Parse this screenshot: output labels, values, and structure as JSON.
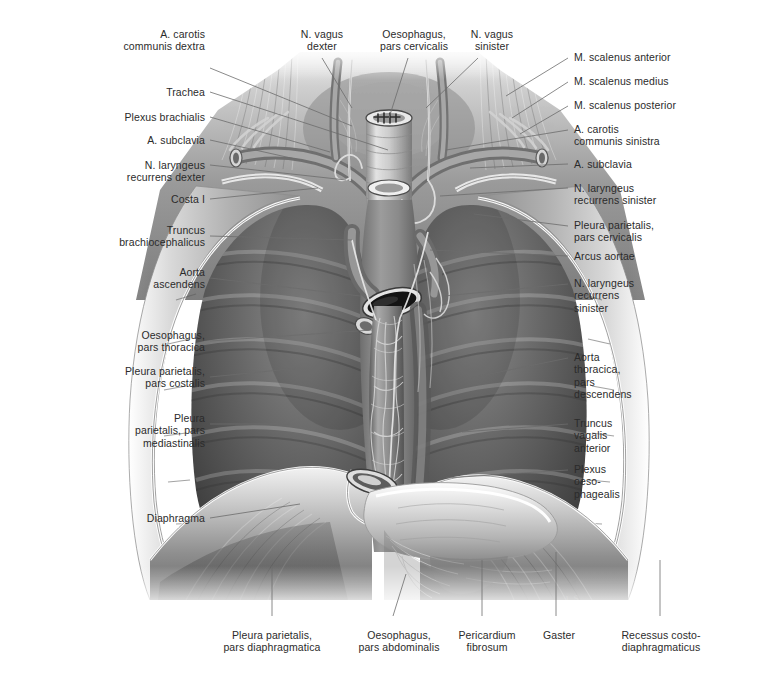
{
  "plate": {
    "title": "Thorax: situs of thoracic organs, anterior view",
    "width": 778,
    "height": 683,
    "background": "#ffffff",
    "text_color": "#2b2b2b",
    "leader_color": "#6c6c6c"
  },
  "labels": {
    "left": [
      {
        "id": "a-carotis-communis-dextra",
        "line1": "A. carotis",
        "line2": "communis dextra"
      },
      {
        "id": "trachea",
        "line1": "Trachea",
        "line2": ""
      },
      {
        "id": "plexus-brachialis",
        "line1": "Plexus brachialis",
        "line2": ""
      },
      {
        "id": "a-subclavia-dextra",
        "line1": "A. subclavia",
        "line2": ""
      },
      {
        "id": "n-laryngeus-recurrens-dexter",
        "line1": "N. laryngeus",
        "line2": "recurrens dexter"
      },
      {
        "id": "costa-i",
        "line1": "Costa I",
        "line2": ""
      },
      {
        "id": "truncus-brachiocephalicus",
        "line1": "Truncus",
        "line2": "brachiocephalicus"
      },
      {
        "id": "aorta-ascendens",
        "line1": "Aorta",
        "line2": "ascendens"
      },
      {
        "id": "oesophagus-pars-thoracica",
        "line1": "Oesophagus,",
        "line2": "pars thoracica"
      },
      {
        "id": "pleura-parietalis-pars-costalis",
        "line1": "Pleura parietalis,",
        "line2": "pars costalis"
      },
      {
        "id": "pleura-parietalis-pars-mediastinalis",
        "line1": "Pleura",
        "line2": "parietalis, pars",
        "line3": "mediastinalis"
      },
      {
        "id": "diaphragma",
        "line1": "Diaphragma",
        "line2": ""
      }
    ],
    "top": [
      {
        "id": "n-vagus-dexter",
        "line1": "N. vagus",
        "line2": "dexter"
      },
      {
        "id": "oesophagus-pars-cervicalis",
        "line1": "Oesophagus,",
        "line2": "pars cervicalis"
      },
      {
        "id": "n-vagus-sinister",
        "line1": "N. vagus",
        "line2": "sinister"
      }
    ],
    "right": [
      {
        "id": "m-scalenus-anterior",
        "line1": "M. scalenus anterior",
        "line2": ""
      },
      {
        "id": "m-scalenus-medius",
        "line1": "M. scalenus medius",
        "line2": ""
      },
      {
        "id": "m-scalenus-posterior",
        "line1": "M. scalenus posterior",
        "line2": ""
      },
      {
        "id": "a-carotis-communis-sinistra",
        "line1": "A. carotis",
        "line2": "communis sinistra"
      },
      {
        "id": "a-subclavia-sinistra",
        "line1": "A. subclavia",
        "line2": ""
      },
      {
        "id": "n-laryngeus-recurrens-sinister-upper",
        "line1": "N. laryngeus",
        "line2": "recurrens sinister"
      },
      {
        "id": "pleura-parietalis-pars-cervicalis",
        "line1": "Pleura parietalis,",
        "line2": "pars cervicalis"
      },
      {
        "id": "arcus-aortae",
        "line1": "Arcus aortae",
        "line2": ""
      },
      {
        "id": "n-laryngeus-recurrens-sinister-lower",
        "line1": "N. laryngeus",
        "line2": "recurrens",
        "line3": "sinister"
      },
      {
        "id": "aorta-thoracica-pars-descendens",
        "line1": "Aorta",
        "line2": "thoracica,",
        "line3": "pars",
        "line4": "descendens"
      },
      {
        "id": "truncus-vagalis-anterior",
        "line1": "Truncus",
        "line2": "vagalis",
        "line3": "anterior"
      },
      {
        "id": "plexus-oesophagealis",
        "line1": "Plexus",
        "line2": "oeso-",
        "line3": "phagealis"
      }
    ],
    "bottom": [
      {
        "id": "pleura-parietalis-pars-diaphragmatica",
        "line1": "Pleura parietalis,",
        "line2": "pars diaphragmatica"
      },
      {
        "id": "oesophagus-pars-abdominalis",
        "line1": "Oesophagus,",
        "line2": "pars abdominalis"
      },
      {
        "id": "pericardium-fibrosum",
        "line1": "Pericardium",
        "line2": "fibrosum"
      },
      {
        "id": "gaster",
        "line1": "Gaster",
        "line2": ""
      },
      {
        "id": "recessus-costo-diaphragmaticus",
        "line1": "Recessus costo-",
        "line2": "diaphragmaticus"
      }
    ]
  }
}
